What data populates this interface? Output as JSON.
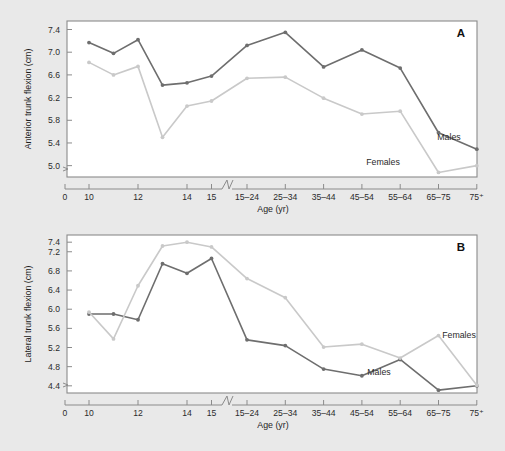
{
  "figure": {
    "background_color": "#e9e9e9",
    "plot_background_color": "#ffffff",
    "axis_color": "#8b8b8b"
  },
  "series_colors": {
    "males": "#6e6e6e",
    "females": "#c9c9c9"
  },
  "panelA": {
    "letter": "A",
    "label_males": "Males",
    "label_females": "Females",
    "xlabel": "Age (yr)",
    "ylabel": "Anterior trunk flexion (cm)",
    "ytick_labels": [
      "7.4",
      "7.0",
      "6.6",
      "6.2",
      "5.8",
      "5.4",
      "5.0"
    ],
    "xtick_labels": [
      "0",
      "10",
      "12",
      "14",
      "15",
      "15–24",
      "25–34",
      "35–44",
      "45–54",
      "55–64",
      "65–75",
      "75⁺"
    ]
  },
  "panelB": {
    "letter": "B",
    "label_males": "Males",
    "label_females": "Females",
    "xlabel": "Age (yr)",
    "ylabel": "Lateral trunk flexion (cm)",
    "ytick_labels": [
      "7.4",
      "7.2",
      "6.8",
      "6.4",
      "6.0",
      "5.6",
      "5.2",
      "4.8",
      "4.4"
    ],
    "xtick_labels": [
      "0",
      "10",
      "12",
      "14",
      "15",
      "15–24",
      "25–34",
      "35–44",
      "45–54",
      "55–64",
      "65–75",
      "75⁺"
    ]
  },
  "chart_data": [
    {
      "type": "line",
      "panel": "A",
      "title": "Anterior trunk flexion (cm) by age",
      "xlabel": "Age (yr)",
      "ylabel": "Anterior trunk flexion (cm)",
      "ylim": [
        4.8,
        7.55
      ],
      "ytick_values": [
        7.4,
        7.0,
        6.6,
        6.2,
        5.8,
        5.4,
        5.0
      ],
      "axis_break": true,
      "axis_break_between": [
        "15",
        "15–24"
      ],
      "grid": false,
      "legend": "inline-annotations",
      "categories": [
        "10",
        "11",
        "12",
        "13",
        "14",
        "15",
        "15–24",
        "25–34",
        "35–44",
        "45–54",
        "55–64",
        "65–75",
        "75⁺"
      ],
      "series": [
        {
          "name": "Males",
          "color": "#6e6e6e",
          "values": [
            7.17,
            6.98,
            7.22,
            6.42,
            6.46,
            6.58,
            7.12,
            7.35,
            6.74,
            7.04,
            6.72,
            5.58,
            5.29
          ]
        },
        {
          "name": "Females",
          "color": "#c9c9c9",
          "values": [
            6.82,
            6.6,
            6.75,
            5.5,
            6.05,
            6.14,
            6.54,
            6.56,
            6.19,
            5.91,
            5.96,
            4.88,
            5.0
          ]
        }
      ]
    },
    {
      "type": "line",
      "panel": "B",
      "title": "Lateral trunk flexion (cm) by age",
      "xlabel": "Age (yr)",
      "ylabel": "Lateral trunk flexion (cm)",
      "ylim": [
        4.25,
        7.55
      ],
      "ytick_values": [
        7.4,
        7.2,
        6.8,
        6.4,
        6.0,
        5.6,
        5.2,
        4.8,
        4.4
      ],
      "axis_break": true,
      "axis_break_between": [
        "15",
        "15–24"
      ],
      "grid": false,
      "legend": "inline-annotations",
      "categories": [
        "10",
        "11",
        "12",
        "13",
        "14",
        "15",
        "15–24",
        "25–34",
        "35–44",
        "45–54",
        "55–64",
        "65–75",
        "75⁺"
      ],
      "series": [
        {
          "name": "Males",
          "color": "#6e6e6e",
          "values": [
            5.9,
            5.9,
            5.78,
            6.95,
            6.75,
            7.06,
            5.36,
            5.24,
            4.75,
            4.61,
            4.95,
            4.31,
            4.4
          ]
        },
        {
          "name": "Females",
          "color": "#c9c9c9",
          "values": [
            5.94,
            5.38,
            6.49,
            7.32,
            7.4,
            7.3,
            6.64,
            6.24,
            5.21,
            5.27,
            4.98,
            5.45,
            4.41
          ]
        }
      ]
    }
  ]
}
